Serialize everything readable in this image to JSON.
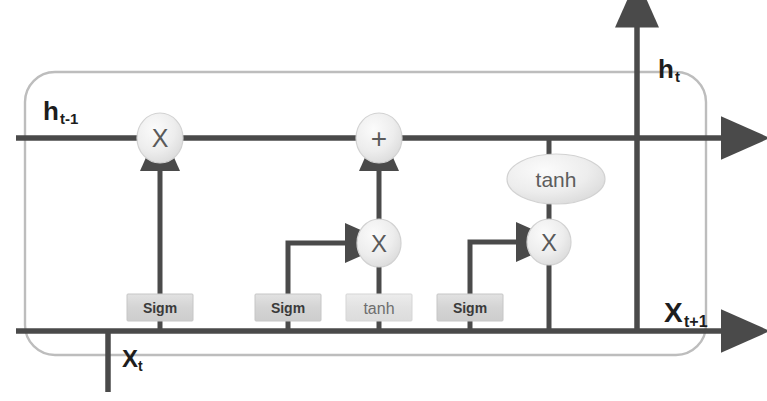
{
  "diagram": {
    "type": "lstm-cell-diagram",
    "canvas": {
      "width": 767,
      "height": 401
    },
    "colors": {
      "background": "#ffffff",
      "line": "#4a4a4a",
      "cell_border": "#b9b9b9",
      "gate_fill": "#d7d7d7",
      "gate_stroke": "#c2c2c2",
      "node_fill": "#ececec",
      "node_stroke": "#cfcfcf",
      "label": "#1d1d1d",
      "gate_label": "#3a3a3a"
    },
    "labels": {
      "hidden_in": {
        "base": "h",
        "sub": "t-1",
        "full": "h t-1"
      },
      "hidden_out": {
        "base": "h",
        "sub": "t",
        "full": "h t"
      },
      "input_in": {
        "base": "X",
        "sub": "t",
        "full": "X t"
      },
      "input_out": {
        "base": "X",
        "sub": "t+1",
        "full": "X t+1"
      }
    },
    "gates": [
      {
        "id": "forget-gate",
        "label": "Sigm",
        "style": "dark",
        "x": 160,
        "y": 306
      },
      {
        "id": "input-gate",
        "label": "Sigm",
        "style": "dark",
        "x": 288,
        "y": 306
      },
      {
        "id": "candidate-gate",
        "label": "tanh",
        "style": "light",
        "x": 379,
        "y": 306
      },
      {
        "id": "output-gate",
        "label": "Sigm",
        "style": "dark",
        "x": 470,
        "y": 306
      }
    ],
    "operators": [
      {
        "id": "forget-multiply",
        "symbol": "X",
        "x": 160,
        "y": 138
      },
      {
        "id": "state-add",
        "symbol": "+",
        "x": 379,
        "y": 138
      },
      {
        "id": "input-multiply",
        "symbol": "X",
        "x": 379,
        "y": 243
      },
      {
        "id": "output-multiply",
        "symbol": "X",
        "x": 549,
        "y": 242
      }
    ],
    "activation_nodes": [
      {
        "id": "state-tanh",
        "label": "tanh",
        "x": 556,
        "y": 179
      }
    ],
    "lines": {
      "cell_state_y": 138,
      "input_bus_y": 331,
      "cell_left_x": 25,
      "cell_right_x": 706,
      "output_branch_x": 637,
      "tanh_branch_x": 549
    }
  }
}
